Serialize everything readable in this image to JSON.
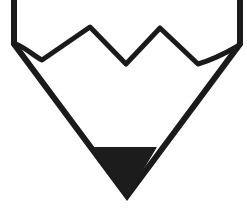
{
  "icon": {
    "name": "pencil-tip-icon",
    "colors": {
      "stroke": "#1a1a1a",
      "fill": "#ffffff",
      "lead": "#1c1c1c",
      "background": "#ffffff"
    }
  }
}
